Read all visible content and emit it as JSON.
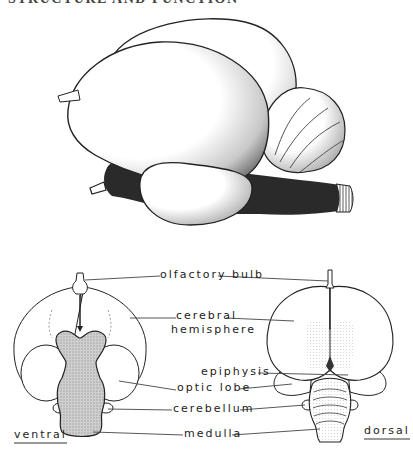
{
  "heading_clipped": "STRUCTURE AND FUNCTION",
  "labels": {
    "olfactory_bulb": "olfactory bulb",
    "cerebral": "cerebral",
    "hemisphere": "hemisphere",
    "epiphysis": "epiphysis",
    "optic_lobe": "optic lobe",
    "cerebellum": "cerebellum",
    "medulla": "medulla"
  },
  "views": {
    "ventral": "ventral",
    "dorsal": "dorsal"
  },
  "colors": {
    "ink": "#222222",
    "stipple": "#bdbdbd",
    "dark_shade": "#2a2a2a",
    "underline": "#999999"
  }
}
